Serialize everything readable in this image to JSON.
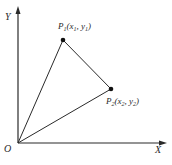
{
  "diagram": {
    "axes": {
      "x_label": "X",
      "y_label": "Y",
      "origin_label": "O"
    },
    "points": [
      {
        "name": "P",
        "index": "1",
        "coords_text": "(x",
        "x_sub": "1",
        "sep": ",  y",
        "y_sub": "1",
        "close": ")"
      },
      {
        "name": "P",
        "index": "2",
        "coords_text": "(x",
        "x_sub": "2",
        "sep": ",  y",
        "y_sub": "2",
        "close": ")"
      }
    ],
    "colors": {
      "line": "#2a2a2a",
      "background": "#ffffff"
    }
  }
}
